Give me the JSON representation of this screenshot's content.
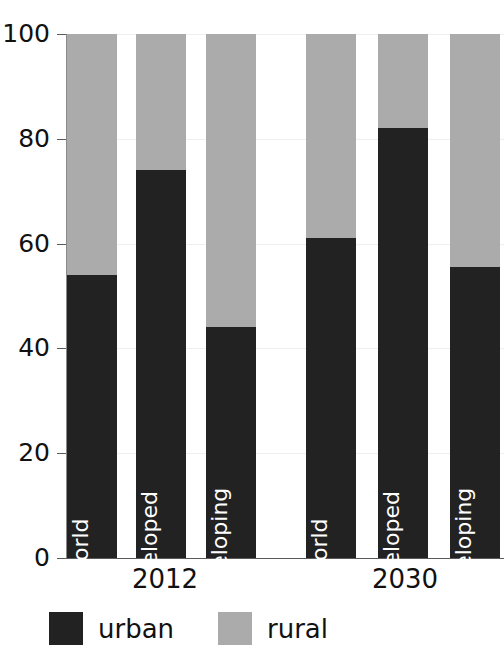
{
  "chart_data": {
    "type": "bar",
    "stacked": true,
    "title": "Urban and rural population",
    "xlabel": "",
    "ylabel": "",
    "ylim": [
      0,
      100
    ],
    "yticks": [
      0,
      20,
      40,
      60,
      80,
      100
    ],
    "ytick_labels": [
      "0",
      "20",
      "40",
      "60",
      "80",
      "100"
    ],
    "grid": true,
    "legend_position": "bottom-left",
    "groups": [
      "2012",
      "2030"
    ],
    "categories": [
      "World",
      "Developed",
      "Developing",
      "World",
      "Developed",
      "Developing"
    ],
    "group_of_category": [
      "2012",
      "2012",
      "2012",
      "2030",
      "2030",
      "2030"
    ],
    "series": [
      {
        "name": "urban",
        "color": "#222222",
        "values": [
          54,
          74,
          44,
          61,
          82,
          55.5
        ]
      },
      {
        "name": "rural",
        "color": "#ababab",
        "values": [
          46,
          26,
          56,
          39,
          18,
          44.5
        ]
      }
    ]
  },
  "axis": {
    "ticks": [
      {
        "label": "100",
        "value": 100
      },
      {
        "label": "80",
        "value": 80
      },
      {
        "label": "60",
        "value": 60
      },
      {
        "label": "40",
        "value": 40
      },
      {
        "label": "20",
        "value": 20
      },
      {
        "label": "0",
        "value": 0
      }
    ]
  },
  "bars": [
    {
      "label": "World",
      "urban": 54,
      "rural": 46,
      "left": 67,
      "width": 50,
      "group": "2012"
    },
    {
      "label": "Developed",
      "urban": 74,
      "rural": 26,
      "left": 136,
      "width": 50,
      "group": "2012"
    },
    {
      "label": "Developing",
      "urban": 44,
      "rural": 56,
      "left": 206,
      "width": 50,
      "group": "2012"
    },
    {
      "label": "World",
      "urban": 61,
      "rural": 39,
      "left": 306,
      "width": 50,
      "group": "2030"
    },
    {
      "label": "Developed",
      "urban": 82,
      "rural": 18,
      "left": 378,
      "width": 50,
      "group": "2030"
    },
    {
      "label": "Developing",
      "urban": 55.5,
      "rural": 44.5,
      "left": 450,
      "width": 50,
      "group": "2030"
    }
  ],
  "groups": [
    {
      "label": "2012",
      "left": 110,
      "width": 110
    },
    {
      "label": "2030",
      "left": 350,
      "width": 110
    }
  ],
  "legend": {
    "items": [
      {
        "label": "urban",
        "color": "#222222",
        "left": 0
      },
      {
        "label": "rural",
        "color": "#ababab",
        "left": 169
      }
    ]
  }
}
